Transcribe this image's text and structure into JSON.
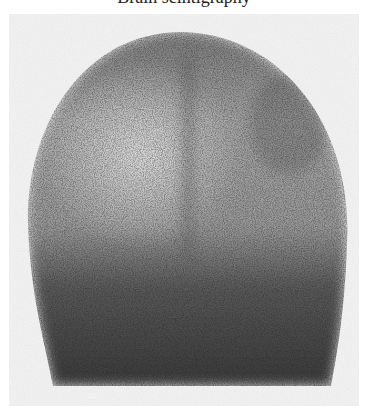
{
  "caption": {
    "text": "Brain scintigraphy"
  },
  "image": {
    "description": "Grayscale nuclear medicine scan of the head (anterior view)",
    "background_color": "#f1f1f1",
    "tracer_color_dark": "#3a3a3a",
    "tracer_color_mid": "#8a8a8a",
    "tracer_color_light": "#c8c8c8"
  }
}
